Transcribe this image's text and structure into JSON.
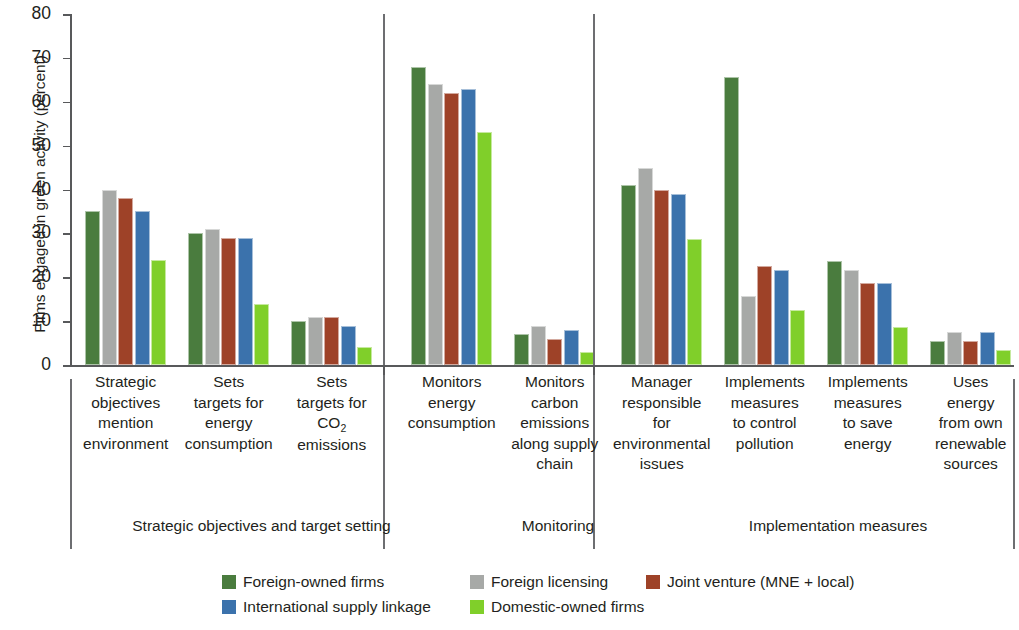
{
  "chart_data": {
    "type": "bar",
    "title": "",
    "xlabel": "",
    "ylabel": "Firms engaged in green activity (percent)",
    "ylim": [
      0,
      80
    ],
    "yticks": [
      0,
      10,
      20,
      30,
      40,
      50,
      60,
      70,
      80
    ],
    "grid": false,
    "legend_position": "bottom",
    "categories": [
      "Strategic objectives mention environment",
      "Sets targets for energy consumption",
      "Sets targets for CO2 emissions",
      "Monitors energy consumption",
      "Monitors carbon emissions along supply chain",
      "Manager responsible for environmental issues",
      "Implements measures to control pollution",
      "Implements measures to save energy",
      "Uses energy from own renewable sources"
    ],
    "category_lines": [
      [
        "Strategic",
        "objectives",
        "mention",
        "environment"
      ],
      [
        "Sets",
        "targets for",
        "energy",
        "consumption"
      ],
      [
        "Sets",
        "targets for",
        "CO2",
        "emissions"
      ],
      [
        "Monitors",
        "energy",
        "consumption"
      ],
      [
        "Monitors",
        "carbon",
        "emissions",
        "along supply",
        "chain"
      ],
      [
        "Manager",
        "responsible",
        "for",
        "environmental",
        "issues"
      ],
      [
        "Implements",
        "measures",
        "to control",
        "pollution"
      ],
      [
        "Implements",
        "measures",
        "to save",
        "energy"
      ],
      [
        "Uses",
        "energy",
        "from own",
        "renewable",
        "sources"
      ]
    ],
    "series": [
      {
        "name": "Foreign-owned firms",
        "color": "#4a7c3e",
        "values": [
          35,
          30,
          10,
          68,
          7,
          41,
          65.7,
          23.6,
          5.5
        ]
      },
      {
        "name": "Foreign licensing",
        "color": "#a7a9a7",
        "values": [
          40,
          31,
          11,
          64,
          9,
          45,
          15.7,
          21.6,
          7.6
        ]
      },
      {
        "name": "Joint venture (MNE + local)",
        "color": "#9e4228",
        "values": [
          38,
          29,
          11,
          62,
          6,
          40,
          22.6,
          18.7,
          5.5
        ]
      },
      {
        "name": "International supply linkage",
        "color": "#3b72ac",
        "values": [
          35,
          29,
          9,
          63,
          8,
          39,
          21.6,
          18.7,
          7.6
        ]
      },
      {
        "name": "Domestic-owned firms",
        "color": "#80cf2a",
        "values": [
          24,
          14,
          4,
          53,
          3,
          28.7,
          12.6,
          8.6,
          3.5
        ]
      }
    ],
    "supergroups": [
      {
        "label": "Strategic objectives and target setting",
        "categories": [
          0,
          1,
          2
        ]
      },
      {
        "label": "Monitoring",
        "categories": [
          3,
          4
        ]
      },
      {
        "label": "Implementation measures",
        "categories": [
          5,
          6,
          7,
          8
        ]
      }
    ]
  }
}
